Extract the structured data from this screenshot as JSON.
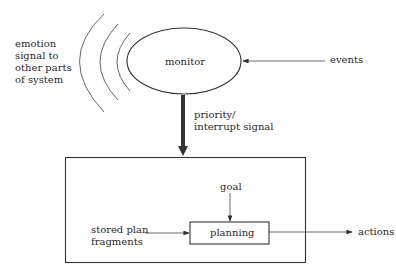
{
  "diagram": {
    "nodes": {
      "monitor": {
        "label": "monitor",
        "shape": "ellipse"
      },
      "planning": {
        "label": "planning",
        "shape": "rectangle"
      },
      "system_box": {
        "label": "",
        "shape": "rectangle"
      }
    },
    "labels": {
      "emotion_line1": "emotion",
      "emotion_line2": "signal to",
      "emotion_line3": "other parts",
      "emotion_line4": "of system",
      "events": "events",
      "priority_line1": "priority/",
      "priority_line2": "interrupt signal",
      "goal": "goal",
      "stored_line1": "stored plan",
      "stored_line2": "fragments",
      "actions": "actions"
    },
    "edges": [
      {
        "from": "events",
        "to": "monitor"
      },
      {
        "from": "monitor",
        "to": "system_box",
        "label": "priority/ interrupt signal",
        "style": "thick"
      },
      {
        "from": "goal",
        "to": "planning"
      },
      {
        "from": "stored plan fragments",
        "to": "planning"
      },
      {
        "from": "planning",
        "to": "actions"
      },
      {
        "from": "monitor",
        "to": "other parts of system",
        "label": "emotion signal",
        "style": "radiating-arcs"
      }
    ],
    "colors": {
      "stroke": "#333333",
      "background": "#ffffff"
    }
  }
}
